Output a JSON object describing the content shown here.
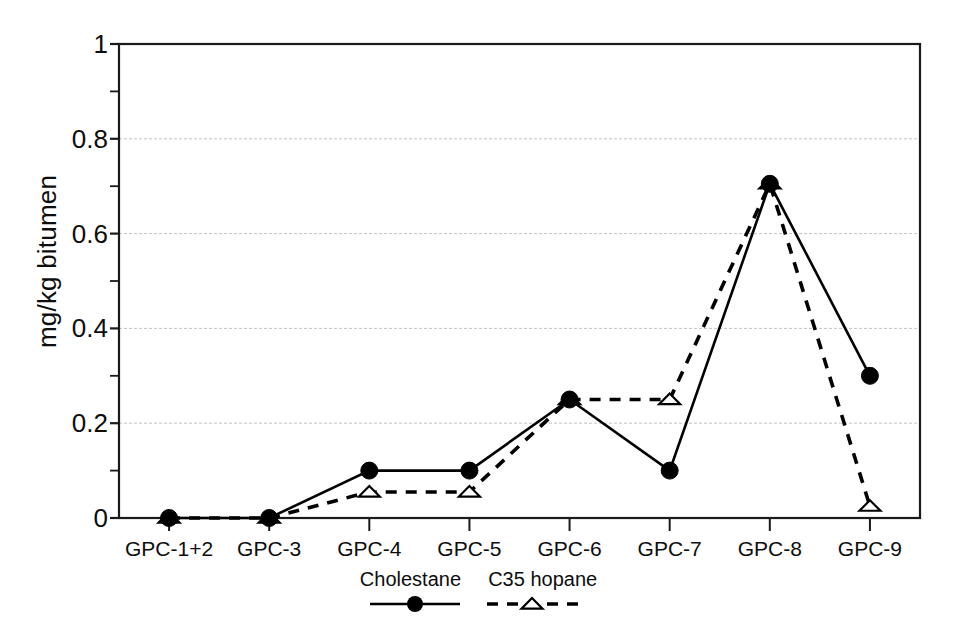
{
  "chart_data": {
    "type": "line",
    "title": "",
    "xlabel": "",
    "ylabel": "mg/kg bitumen",
    "categories": [
      "GPC-1+2",
      "GPC-3",
      "GPC-4",
      "GPC-5",
      "GPC-6",
      "GPC-7",
      "GPC-8",
      "GPC-9"
    ],
    "series": [
      {
        "name": "Cholestane",
        "marker": "filled-circle",
        "linestyle": "solid",
        "color": "#000000",
        "values": [
          0,
          0,
          0.1,
          0.1,
          0.25,
          0.1,
          0.705,
          0.3
        ]
      },
      {
        "name": "C35 hopane",
        "marker": "open-triangle",
        "linestyle": "dashed",
        "color": "#000000",
        "values": [
          0,
          0,
          0.055,
          0.055,
          0.25,
          0.25,
          0.705,
          0.025
        ]
      }
    ],
    "ylim": [
      0,
      1
    ],
    "ytick_labels": [
      "0",
      "0.2",
      "0.4",
      "0.6",
      "0.8",
      "1"
    ],
    "ytick_values": [
      0,
      0.2,
      0.4,
      0.6,
      0.8,
      1
    ],
    "yminor_ticks": [
      0.1,
      0.3,
      0.5,
      0.7,
      0.9
    ],
    "grid": "horizontal-major",
    "legend_position": "below-axis-center",
    "legend_entries": [
      "Cholestane",
      "C35 hopane"
    ]
  },
  "axes": {
    "frame_color": "#1a1a1a",
    "grid_color": "#b9b9b9"
  }
}
